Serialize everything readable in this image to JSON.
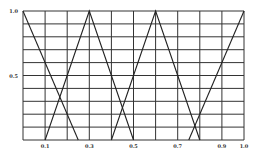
{
  "chart_data": {
    "type": "line",
    "title": "",
    "xlabel": "",
    "ylabel": "",
    "xlim": [
      0,
      1.0
    ],
    "ylim": [
      0,
      1.0
    ],
    "grid": true,
    "grid_x_step": 0.1,
    "grid_y_step": 0.1,
    "x_tick_labels": [
      "0.1",
      "0.3",
      "0.5",
      "0.7",
      "0.9",
      "1.0"
    ],
    "x_tick_values": [
      0.1,
      0.3,
      0.5,
      0.7,
      0.9,
      1.0
    ],
    "y_tick_labels": [
      "0.5",
      "1.0"
    ],
    "y_tick_values": [
      0.5,
      1.0
    ],
    "legend": [],
    "series": [
      {
        "name": "membership-1",
        "x": [
          0.0,
          0.25
        ],
        "y": [
          1.0,
          0.0
        ]
      },
      {
        "name": "membership-2",
        "x": [
          0.1,
          0.3,
          0.5
        ],
        "y": [
          0.0,
          1.0,
          0.0
        ]
      },
      {
        "name": "membership-3",
        "x": [
          0.4,
          0.6,
          0.8
        ],
        "y": [
          0.0,
          1.0,
          0.0
        ]
      },
      {
        "name": "membership-4",
        "x": [
          0.75,
          1.0
        ],
        "y": [
          0.0,
          1.0
        ]
      }
    ],
    "colors": {
      "line": "#222222",
      "grid": "#333333",
      "background": "#ffffff"
    }
  }
}
